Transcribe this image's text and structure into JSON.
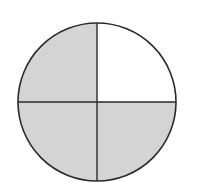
{
  "diagram": {
    "type": "fraction-circle",
    "total_parts": 4,
    "shaded_parts": 3,
    "fraction": "3/4",
    "parts": [
      {
        "position": "top-left",
        "shaded": true
      },
      {
        "position": "top-right",
        "shaded": false
      },
      {
        "position": "bottom-left",
        "shaded": true
      },
      {
        "position": "bottom-right",
        "shaded": true
      }
    ],
    "colors": {
      "shaded": "#d4d4d4",
      "unshaded": "#ffffff",
      "stroke": "#2a2a2a"
    }
  }
}
